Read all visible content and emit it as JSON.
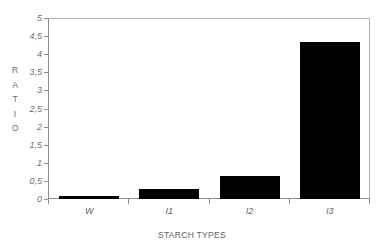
{
  "chart_data": {
    "type": "bar",
    "title": "",
    "categories": [
      "W",
      "I1",
      "I2",
      "I3"
    ],
    "values": [
      0.07,
      0.28,
      0.64,
      4.35
    ],
    "series": [
      {
        "name": "Ratio",
        "values": [
          0.07,
          0.28,
          0.64,
          4.35
        ]
      }
    ],
    "xlabel": "STARCH TYPES",
    "ylabel": "RATIO",
    "ylabel_letters": [
      "R",
      "A",
      "T",
      "I",
      "O"
    ],
    "ylim": [
      0,
      5
    ],
    "ytick_values": [
      0,
      0.5,
      1,
      1.5,
      2,
      2.5,
      3,
      3.5,
      4,
      4.5,
      5
    ],
    "ytick_labels": [
      "0",
      "0,5",
      "1",
      "1,5",
      "2",
      "2,5",
      "3",
      "3,5",
      "4",
      "4,5",
      "5"
    ],
    "grid": false,
    "legend": false,
    "bar_color": "#000000",
    "frame_color": "#b4b4b4",
    "axis_color": "#8c8c8c",
    "text_color": "#5f5f5f",
    "background": "#ffffff"
  }
}
